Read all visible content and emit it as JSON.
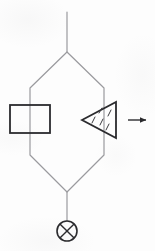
{
  "diagram": {
    "background_color": "#fdfdfd",
    "line_color_thin": "#9a9a9e",
    "line_color_thick": "#2b2b2e",
    "canvas": {
      "width": 155,
      "height": 251
    },
    "elements": [
      {
        "id": "top-supply-line",
        "name": "top-supply-line",
        "type": "line",
        "label": "Top vertical supply line",
        "stroke": "#9a9a9e",
        "stroke_width": 1.2,
        "points": [
          [
            67,
            12
          ],
          [
            67,
            52
          ]
        ]
      },
      {
        "id": "hexagon-loop",
        "name": "hexagon-loop",
        "type": "polygon",
        "label": "Hexagonal parallel circuit loop",
        "stroke": "#9a9a9e",
        "stroke_width": 1.2,
        "fill": "none",
        "points": [
          [
            67,
            52
          ],
          [
            30,
            88
          ],
          [
            30,
            155
          ],
          [
            67,
            192
          ],
          [
            104,
            155
          ],
          [
            104,
            88
          ]
        ]
      },
      {
        "id": "bottom-drain-line",
        "name": "bottom-drain-line",
        "type": "line",
        "label": "Bottom vertical drain line",
        "stroke": "#9a9a9e",
        "stroke_width": 1.2,
        "points": [
          [
            67,
            192
          ],
          [
            67,
            221
          ]
        ]
      },
      {
        "id": "rectangle-component",
        "name": "rectangle-component",
        "type": "rect",
        "label": "Rectangular block component on left branch",
        "stroke": "#2b2b2e",
        "stroke_width": 1.8,
        "fill": "none",
        "x": 10,
        "y": 105,
        "width": 40,
        "height": 28
      },
      {
        "id": "triangle-component",
        "name": "triangle-component",
        "type": "polygon",
        "label": "Left-pointing triangular component on right branch",
        "stroke": "#2b2b2e",
        "stroke_width": 1.8,
        "fill": "none",
        "points": [
          [
            82,
            120
          ],
          [
            116,
            102
          ],
          [
            116,
            138
          ]
        ]
      },
      {
        "id": "triangle-hatch-marks",
        "name": "triangle-hatch-marks",
        "type": "hatch-group",
        "label": "Diagonal hatch tick marks inside triangle",
        "stroke": "#3a3a3e",
        "stroke_width": 1.0,
        "strokes": [
          [
            [
              92,
              123
            ],
            [
              95,
              117
            ]
          ],
          [
            [
              100,
              125
            ],
            [
              103,
              119
            ]
          ],
          [
            [
              108,
              116
            ],
            [
              111,
              110
            ]
          ],
          [
            [
              106,
              130
            ],
            [
              109,
              124
            ]
          ],
          [
            [
              99,
              113
            ],
            [
              102,
              108
            ]
          ]
        ]
      },
      {
        "id": "right-arrow",
        "name": "right-arrow",
        "type": "arrow",
        "label": "Short right-pointing flow arrow",
        "stroke": "#2b2b2e",
        "stroke_width": 1.4,
        "points": [
          [
            128,
            120
          ],
          [
            148,
            120
          ]
        ],
        "arrowhead_at": "end"
      },
      {
        "id": "crossed-circle",
        "name": "crossed-circle",
        "type": "circle-with-x",
        "label": "Crossed circle terminal symbol",
        "stroke": "#2b2b2e",
        "stroke_width": 1.6,
        "fill": "none",
        "cx": 67,
        "cy": 231,
        "r": 10
      }
    ]
  }
}
